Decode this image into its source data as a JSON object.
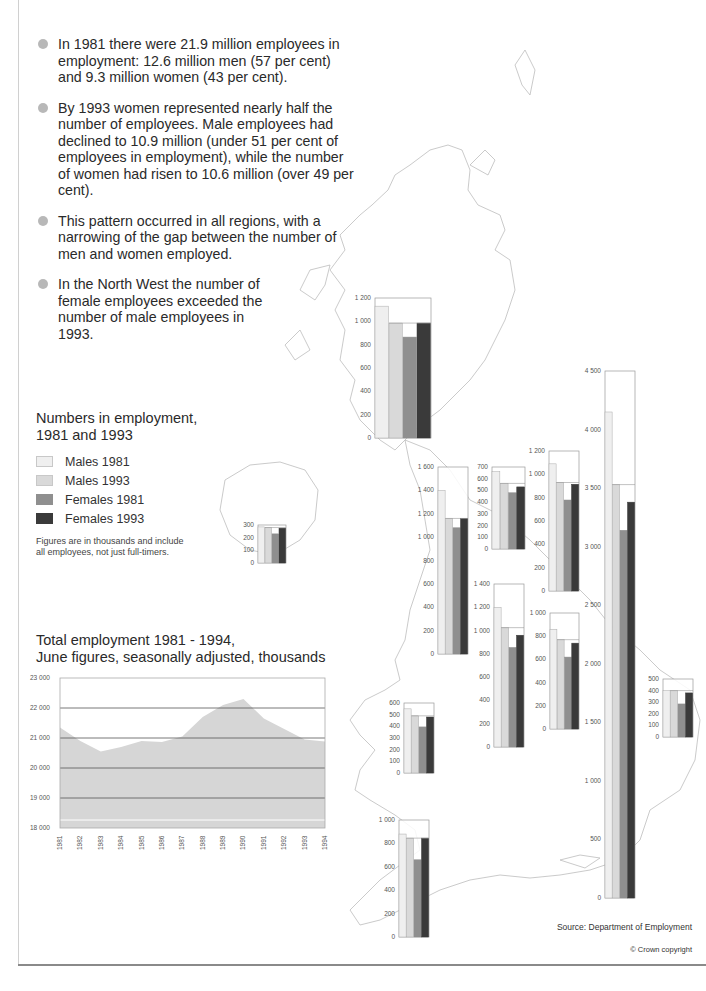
{
  "bullets": [
    "In 1981 there were 21.9 million employees in employment: 12.6 million men (57 per cent) and 9.3 million women (43 per cent).",
    "By 1993 women represented nearly half the number of employees. Male employees had declined to 10.9 million (under 51 per cent of employees in employment), while the number of women had risen to 10.6 million (over 49 per cent).",
    "This pattern occurred in all regions, with a narrowing of the gap between the number of men and women employed.",
    "In the North West the number of female employees exceeded the number of male employees in 1993."
  ],
  "legend": {
    "title_line1": "Numbers in employment,",
    "title_line2": "1981 and 1993",
    "items": [
      {
        "label": "Males 1981",
        "color": "#efefef"
      },
      {
        "label": "Males 1993",
        "color": "#d9d9d9"
      },
      {
        "label": "Females 1981",
        "color": "#8f8f8f"
      },
      {
        "label": "Females 1993",
        "color": "#3a3a3a"
      }
    ],
    "note": "Figures are in thousands and include all employees, not just full-timers."
  },
  "line_chart": {
    "title_line1": "Total employment 1981 - 1994,",
    "title_line2": "June figures, seasonally adjusted, thousands"
  },
  "footer": {
    "source": "Source: Department of Employment",
    "copyright": "© Crown copyright"
  },
  "chart_data": [
    {
      "type": "area",
      "title": "Total employment 1981 - 1994, June figures, seasonally adjusted, thousands",
      "xlabel": "",
      "ylabel": "thousands",
      "x": [
        "1981",
        "1982",
        "1983",
        "1984",
        "1985",
        "1986",
        "1987",
        "1988",
        "1989",
        "1990",
        "1991",
        "1992",
        "1993",
        "1994"
      ],
      "values": [
        21350,
        20900,
        20550,
        20700,
        20900,
        20870,
        21050,
        21700,
        22100,
        22300,
        21650,
        21300,
        20950,
        20880
      ],
      "yticks": [
        "18 000",
        "19 000",
        "20 000",
        "21 000",
        "22 000",
        "23 000"
      ],
      "ylim": [
        18000,
        23000
      ],
      "grid": true,
      "fill_color": "#d6d6d6"
    },
    {
      "type": "bar",
      "title": "Numbers in employment, 1981 and 1993 (thousands)",
      "series_names": [
        "Males 1981",
        "Males 1993",
        "Females 1981",
        "Females 1993"
      ],
      "legend_position": "left",
      "regions": [
        {
          "name": "Scotland",
          "ymax": 1200,
          "ticks": [
            0,
            200,
            400,
            600,
            800,
            1000,
            1200
          ],
          "values": [
            1130,
            985,
            865,
            985
          ],
          "x": 375,
          "y": 298,
          "w": 56,
          "h": 140
        },
        {
          "name": "Northern Ireland",
          "ymax": 300,
          "ticks": [
            0,
            100,
            200,
            300
          ],
          "values": [
            285,
            280,
            230,
            275
          ],
          "x": 258,
          "y": 525,
          "w": 28,
          "h": 38
        },
        {
          "name": "North West",
          "ymax": 1600,
          "ticks": [
            0,
            200,
            400,
            600,
            800,
            1000,
            1200,
            1400,
            1600
          ],
          "values": [
            1400,
            1160,
            1080,
            1160
          ],
          "x": 438,
          "y": 467,
          "w": 30,
          "h": 187
        },
        {
          "name": "North",
          "ymax": 700,
          "ticks": [
            0,
            100,
            200,
            300,
            400,
            500,
            600,
            700
          ],
          "values": [
            660,
            560,
            480,
            530
          ],
          "x": 492,
          "y": 467,
          "w": 33,
          "h": 82
        },
        {
          "name": "Yorkshire and Humberside",
          "ymax": 1200,
          "ticks": [
            0,
            200,
            400,
            600,
            800,
            1000,
            1200
          ],
          "values": [
            1090,
            930,
            780,
            915
          ],
          "x": 549,
          "y": 451,
          "w": 30,
          "h": 140
        },
        {
          "name": "West Midlands",
          "ymax": 1400,
          "ticks": [
            0,
            200,
            400,
            600,
            800,
            1000,
            1200,
            1400
          ],
          "values": [
            1200,
            1025,
            855,
            960
          ],
          "x": 494,
          "y": 584,
          "w": 30,
          "h": 163
        },
        {
          "name": "East Midlands",
          "ymax": 1000,
          "ticks": [
            0,
            200,
            400,
            600,
            800,
            1000
          ],
          "values": [
            860,
            770,
            620,
            740
          ],
          "x": 550,
          "y": 613,
          "w": 29,
          "h": 116
        },
        {
          "name": "South East",
          "ymax": 4500,
          "ticks": [
            0,
            500,
            1000,
            1500,
            2000,
            2500,
            3000,
            3500,
            4000,
            4500
          ],
          "values": [
            4150,
            3530,
            3140,
            3380
          ],
          "x": 605,
          "y": 371,
          "w": 30,
          "h": 527
        },
        {
          "name": "East Anglia",
          "ymax": 500,
          "ticks": [
            0,
            100,
            200,
            300,
            400,
            500
          ],
          "values": [
            400,
            400,
            285,
            380
          ],
          "x": 663,
          "y": 679,
          "w": 30,
          "h": 58
        },
        {
          "name": "Wales",
          "ymax": 600,
          "ticks": [
            0,
            100,
            200,
            300,
            400,
            500,
            600
          ],
          "values": [
            550,
            490,
            395,
            480
          ],
          "x": 404,
          "y": 703,
          "w": 30,
          "h": 70
        },
        {
          "name": "South West",
          "ymax": 1000,
          "ticks": [
            0,
            200,
            400,
            600,
            800,
            1000
          ],
          "values": [
            880,
            845,
            660,
            845
          ],
          "x": 399,
          "y": 820,
          "w": 30,
          "h": 117
        }
      ]
    }
  ]
}
